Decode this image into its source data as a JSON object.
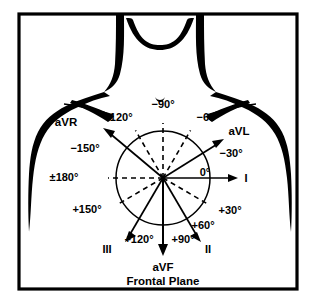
{
  "figure": {
    "caption": "Frontal Plane",
    "frame_color": "#000000",
    "ink_color": "#000000",
    "background": "#ffffff"
  },
  "diagram": {
    "title": "Frontal Plane",
    "type": "hexaxial-reference-system",
    "center": {
      "x": 163,
      "y": 178
    },
    "circle_radius": 47,
    "leads": [
      {
        "name": "aVR",
        "label": "aVR",
        "angle_deg": -150,
        "style": "solid",
        "arrow": true,
        "label_x": 66,
        "label_y": 122,
        "tip_x": 104,
        "tip_y": 129
      },
      {
        "name": "aVL",
        "label": "aVL",
        "angle_deg": -30,
        "style": "solid",
        "arrow": true,
        "label_x": 228,
        "label_y": 135,
        "tip_x": 222,
        "tip_y": 141
      },
      {
        "name": "I",
        "label": "I",
        "angle_deg": 0,
        "style": "solid",
        "arrow": true,
        "label_x": 243,
        "label_y": 182,
        "tip_x": 237,
        "tip_y": 178
      },
      {
        "name": "II",
        "label": "II",
        "angle_deg": 60,
        "style": "solid",
        "arrow": true,
        "label_x": 206,
        "label_y": 251,
        "tip_x": 201,
        "tip_y": 240
      },
      {
        "name": "III",
        "label": "III",
        "angle_deg": 120,
        "style": "solid",
        "arrow": true,
        "label_x": 103,
        "label_y": 251,
        "tip_x": 125,
        "tip_y": 240
      },
      {
        "name": "aVF",
        "label": "aVF",
        "angle_deg": 90,
        "style": "solid",
        "arrow": true,
        "label_x": 163,
        "label_y": 269,
        "tip_x": 163,
        "tip_y": 254
      }
    ],
    "angle_labels": [
      {
        "text": "−90°",
        "angle_deg": -90,
        "x": 163,
        "y": 108,
        "anchor": "middle"
      },
      {
        "text": "−120°",
        "angle_deg": -120,
        "x": 118,
        "y": 121,
        "anchor": "middle"
      },
      {
        "text": "−60°",
        "angle_deg": -60,
        "x": 208,
        "y": 121,
        "anchor": "middle"
      },
      {
        "text": "−150°",
        "angle_deg": -150,
        "x": 85,
        "y": 152,
        "anchor": "middle"
      },
      {
        "text": "−30°",
        "angle_deg": -30,
        "x": 231,
        "y": 157,
        "anchor": "middle"
      },
      {
        "text": "±180°",
        "angle_deg": 180,
        "x": 64,
        "y": 181,
        "anchor": "middle"
      },
      {
        "text": "0°",
        "angle_deg": 0,
        "x": 205,
        "y": 176,
        "anchor": "middle"
      },
      {
        "text": "+150°",
        "angle_deg": 150,
        "x": 87,
        "y": 213,
        "anchor": "middle"
      },
      {
        "text": "+30°",
        "angle_deg": 30,
        "x": 230,
        "y": 214,
        "anchor": "middle"
      },
      {
        "text": "+60°",
        "angle_deg": 60,
        "x": 203,
        "y": 229,
        "anchor": "middle"
      },
      {
        "text": "+120°",
        "angle_deg": 120,
        "x": 139,
        "y": 243,
        "anchor": "middle"
      },
      {
        "text": "+90°",
        "angle_deg": 90,
        "x": 183,
        "y": 243,
        "anchor": "middle"
      }
    ],
    "dashed_rays": [
      {
        "name": "ray-minus-90",
        "angle_deg": -90
      },
      {
        "name": "ray-minus-120",
        "angle_deg": -120
      },
      {
        "name": "ray-minus-60",
        "angle_deg": -60
      },
      {
        "name": "ray-180",
        "angle_deg": 180
      },
      {
        "name": "ray-plus-150",
        "angle_deg": 150
      },
      {
        "name": "ray-plus-30",
        "angle_deg": 30
      }
    ]
  }
}
